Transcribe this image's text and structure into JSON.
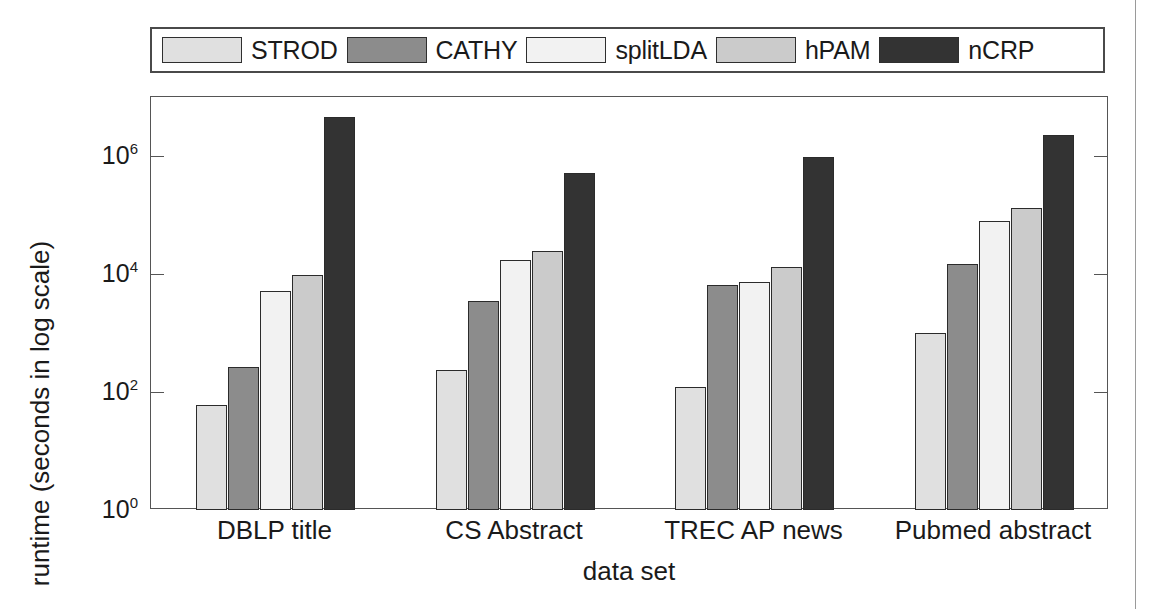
{
  "page": {
    "background": "#ffffff",
    "margin_rule_color": "#9a9a9a"
  },
  "legend": {
    "position": "above-plot",
    "entries": [
      {
        "label": "STROD",
        "color": "#e0e0e0"
      },
      {
        "label": "CATHY",
        "color": "#8c8c8c"
      },
      {
        "label": "splitLDA",
        "color": "#f2f2f2"
      },
      {
        "label": "hPAM",
        "color": "#cbcbcb"
      },
      {
        "label": "nCRP",
        "color": "#333333"
      }
    ]
  },
  "axes": {
    "y_title": "runtime (seconds in log scale)",
    "x_title": "data set",
    "y_ticks": [
      {
        "mantissa": "10",
        "exponent": "0",
        "value": 1
      },
      {
        "mantissa": "10",
        "exponent": "2",
        "value": 100
      },
      {
        "mantissa": "10",
        "exponent": "4",
        "value": 10000
      },
      {
        "mantissa": "10",
        "exponent": "6",
        "value": 1000000
      }
    ]
  },
  "chart_data": {
    "type": "bar",
    "title": "",
    "xlabel": "data set",
    "ylabel": "runtime (seconds in log scale)",
    "yscale": "log",
    "ylim": [
      1,
      10000000
    ],
    "grid": false,
    "legend_position": "top",
    "categories": [
      "DBLP title",
      "CS Abstract",
      "TREC AP news",
      "Pubmed abstract"
    ],
    "series": [
      {
        "name": "STROD",
        "color": "#e0e0e0",
        "values": [
          60,
          235,
          120,
          1000
        ]
      },
      {
        "name": "CATHY",
        "color": "#8c8c8c",
        "values": [
          270,
          3500,
          6500,
          15000
        ]
      },
      {
        "name": "splitLDA",
        "color": "#f2f2f2",
        "values": [
          5100,
          17000,
          7300,
          80000
        ]
      },
      {
        "name": "hPAM",
        "color": "#cbcbcb",
        "values": [
          9500,
          25000,
          13000,
          130000
        ]
      },
      {
        "name": "nCRP",
        "color": "#333333",
        "values": [
          4600000,
          520000,
          960000,
          2300000
        ]
      }
    ]
  }
}
